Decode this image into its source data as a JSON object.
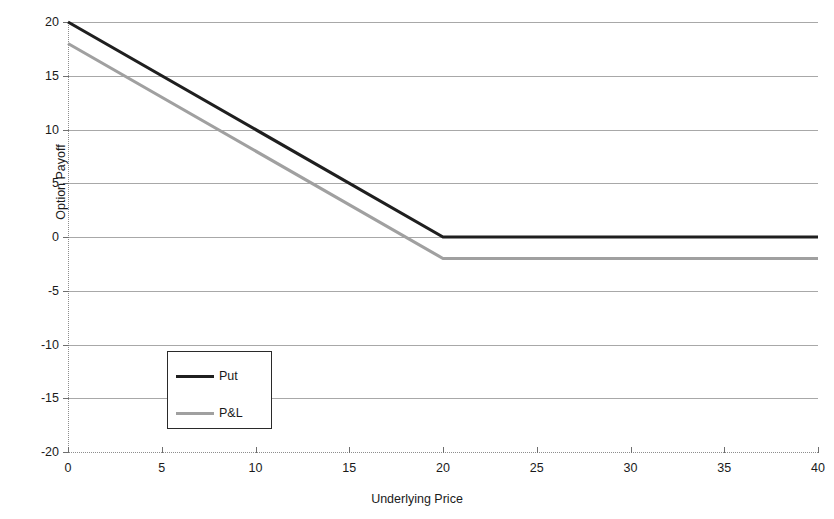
{
  "chart_data": {
    "type": "line",
    "title": "",
    "xlabel": "Underlying Price",
    "ylabel": "Option Payoff",
    "xlim": [
      0,
      40
    ],
    "ylim": [
      -20,
      20
    ],
    "xticks": [
      "0",
      "5",
      "10",
      "15",
      "20",
      "25",
      "30",
      "35",
      "40"
    ],
    "yticks": [
      "20",
      "15",
      "10",
      "5",
      "0",
      "-5",
      "-10",
      "-15",
      "-20"
    ],
    "grid": "horizontal",
    "legend_position": "inner-left-lower",
    "strike": 20,
    "premium": 2,
    "series": [
      {
        "name": "Put",
        "color": "#1f1f1f",
        "width": 3.1,
        "x": [
          0,
          20,
          40
        ],
        "values": [
          20,
          0,
          0
        ]
      },
      {
        "name": "P&L",
        "color": "#a0a0a0",
        "width": 3.1,
        "x": [
          0,
          20,
          40
        ],
        "values": [
          18,
          -2,
          -2
        ]
      }
    ],
    "legend": [
      {
        "label": "Put",
        "color": "#1f1f1f"
      },
      {
        "label": "P&L",
        "color": "#a0a0a0"
      }
    ],
    "colors": {
      "gridline": "#a8a8a8",
      "axis": "#8d8d8d",
      "tick": "#6e6e6e",
      "text": "#1a1a1a",
      "background": "#ffffff",
      "legend_border": "#2a2a2a"
    }
  }
}
